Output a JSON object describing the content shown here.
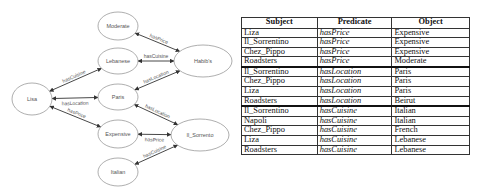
{
  "graph": {
    "nodes": [
      {
        "id": "moderate",
        "label": "Moderate",
        "cx": 118,
        "cy": 26,
        "rx": 20,
        "ry": 14
      },
      {
        "id": "lebanese",
        "label": "Lebanese",
        "cx": 118,
        "cy": 61,
        "rx": 20,
        "ry": 13
      },
      {
        "id": "habibs",
        "label": "Habib's",
        "cx": 203,
        "cy": 61,
        "rx": 29,
        "ry": 16
      },
      {
        "id": "lisa",
        "label": "Lisa",
        "cx": 32,
        "cy": 99,
        "rx": 20,
        "ry": 16
      },
      {
        "id": "paris",
        "label": "Paris",
        "cx": 118,
        "cy": 97,
        "rx": 20,
        "ry": 13
      },
      {
        "id": "expensive",
        "label": "Expensive",
        "cx": 118,
        "cy": 134,
        "rx": 20,
        "ry": 14
      },
      {
        "id": "il_sorrento",
        "label": "Il_Sorrento",
        "cx": 200,
        "cy": 135,
        "rx": 29,
        "ry": 16
      },
      {
        "id": "italian",
        "label": "Italian",
        "cx": 118,
        "cy": 172,
        "rx": 20,
        "ry": 14
      }
    ],
    "edges": [
      {
        "label": "hasPrice",
        "from": "moderate",
        "to": "habibs"
      },
      {
        "label": "hasCuisine",
        "from": "lebanese",
        "to": "habibs"
      },
      {
        "label": "hasLocation",
        "from": "paris",
        "to": "habibs"
      },
      {
        "label": "hasCuisine",
        "from": "lisa",
        "to": "lebanese"
      },
      {
        "label": "hasLocation",
        "from": "lisa",
        "to": "paris"
      },
      {
        "label": "hasPrice",
        "from": "lisa",
        "to": "expensive"
      },
      {
        "label": "hasLocation",
        "from": "paris",
        "to": "il_sorrento"
      },
      {
        "label": "hasPrice",
        "from": "expensive",
        "to": "il_sorrento"
      },
      {
        "label": "hasCuisine",
        "from": "italian",
        "to": "il_sorrento"
      }
    ]
  },
  "table": {
    "headers": [
      "Subject",
      "Predicate",
      "Object"
    ],
    "rows": [
      [
        "Liza",
        "hasPrice",
        "Expensive"
      ],
      [
        "Il_Sorrentino",
        "hasPrice",
        "Expensive"
      ],
      [
        "Chez_Pippo",
        "hasPrice",
        "Expensive"
      ],
      [
        "Roadsters",
        "hasPrice",
        "Moderate"
      ],
      [
        "Il_Sorrentino",
        "hasLocation",
        "Paris"
      ],
      [
        "Chez_Pippo",
        "hasLocation",
        "Paris"
      ],
      [
        "Liza",
        "hasLocation",
        "Paris"
      ],
      [
        "Roadsters",
        "hasLocation",
        "Beirut"
      ],
      [
        "Il_Sorrentino",
        "hasCuisine",
        "Italian"
      ],
      [
        "Napoli",
        "hasCuisine",
        "Italian"
      ],
      [
        "Chez_Pippo",
        "hasCuisine",
        "French"
      ],
      [
        "Liza",
        "hasCuisine",
        "Lebanese"
      ],
      [
        "Roadsters",
        "hasCuisine",
        "Lebanese"
      ]
    ],
    "group_end_rows": [
      3,
      7
    ]
  }
}
